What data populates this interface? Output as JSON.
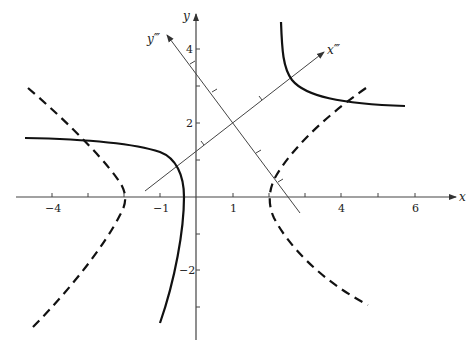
{
  "figure": {
    "type": "coordinate-plot",
    "axes": {
      "x_label": "x",
      "y_label": "y",
      "x_tick_labels": [
        "−4",
        "−1",
        "1",
        "4",
        "6"
      ],
      "y_tick_labels": [
        "4",
        "2",
        "−2"
      ],
      "rotated_x_label": "x‴",
      "rotated_y_label": "y‴",
      "rotated_origin": [
        1,
        2
      ]
    },
    "curves": [
      {
        "name": "solid-hyperbola-upper-right",
        "style": "solid"
      },
      {
        "name": "solid-hyperbola-left",
        "style": "solid"
      },
      {
        "name": "dashed-hyperbola-left",
        "style": "dashed"
      },
      {
        "name": "dashed-hyperbola-right",
        "style": "dashed"
      }
    ]
  }
}
